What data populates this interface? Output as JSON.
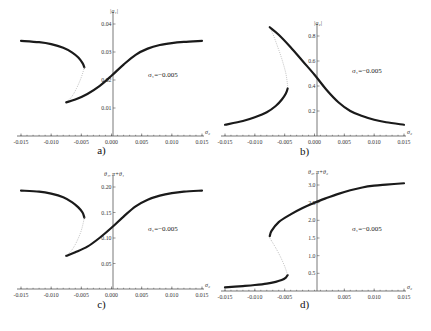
{
  "chart_data": [
    {
      "id": "a",
      "type": "line",
      "panel_label": "a)",
      "ylabel": "|a₁|",
      "xlabel": "σ₂",
      "annotation": "σ₁=−0.005",
      "xlim": [
        -0.015,
        0.015
      ],
      "ylim": [
        0,
        0.04
      ],
      "xticks": [
        "-0.015",
        "-0.010",
        "-0.005",
        "0.000",
        "0.005",
        "0.010",
        "0.015"
      ],
      "xtick_values": [
        -0.015,
        -0.01,
        -0.005,
        0.0,
        0.005,
        0.01,
        0.015
      ],
      "yticks": [
        "0.01",
        "0.02",
        "0.03",
        "0.04"
      ],
      "ytick_values": [
        0.01,
        0.02,
        0.03,
        0.04
      ],
      "series": [
        {
          "name": "stable-upper",
          "style": "stable",
          "x": [
            -0.015,
            -0.012,
            -0.01,
            -0.008,
            -0.0065,
            -0.0055,
            -0.0048,
            -0.0045
          ],
          "y": [
            0.034,
            0.0335,
            0.0328,
            0.0315,
            0.0298,
            0.028,
            0.026,
            0.0245
          ]
        },
        {
          "name": "unstable",
          "style": "unstable",
          "x": [
            -0.0045,
            -0.005,
            -0.0058,
            -0.0066,
            -0.0075
          ],
          "y": [
            0.0245,
            0.021,
            0.017,
            0.014,
            0.012
          ]
        },
        {
          "name": "stable-lower",
          "style": "stable",
          "x": [
            -0.0075,
            -0.006,
            -0.004,
            -0.002,
            0.0,
            0.002,
            0.004,
            0.006,
            0.008,
            0.01,
            0.012,
            0.015
          ],
          "y": [
            0.012,
            0.013,
            0.015,
            0.0178,
            0.0215,
            0.0255,
            0.029,
            0.0312,
            0.0325,
            0.0332,
            0.0336,
            0.034
          ]
        }
      ]
    },
    {
      "id": "b",
      "type": "line",
      "panel_label": "b)",
      "ylabel": "|a₂|",
      "xlabel": "σ₂",
      "annotation": "σ₁=−0.005",
      "xlim": [
        -0.015,
        0.015
      ],
      "ylim": [
        0,
        0.9
      ],
      "xticks": [
        "-0.015",
        "-0.010",
        "-0.005",
        "0.000",
        "0.005",
        "0.010",
        "0.015"
      ],
      "xtick_values": [
        -0.015,
        -0.01,
        -0.005,
        0.0,
        0.005,
        0.01,
        0.015
      ],
      "yticks": [
        "0.2",
        "0.4",
        "0.6",
        "0.8"
      ],
      "ytick_values": [
        0.2,
        0.4,
        0.6,
        0.8
      ],
      "series": [
        {
          "name": "stable-lower",
          "style": "stable",
          "x": [
            -0.015,
            -0.012,
            -0.01,
            -0.008,
            -0.0065,
            -0.0055,
            -0.0048,
            -0.0045
          ],
          "y": [
            0.09,
            0.12,
            0.15,
            0.19,
            0.24,
            0.29,
            0.34,
            0.38
          ]
        },
        {
          "name": "unstable",
          "style": "unstable",
          "x": [
            -0.0045,
            -0.0048,
            -0.0055,
            -0.0063,
            -0.007,
            -0.0075
          ],
          "y": [
            0.4,
            0.5,
            0.62,
            0.73,
            0.82,
            0.87
          ]
        },
        {
          "name": "stable-upper",
          "style": "stable",
          "x": [
            -0.0075,
            -0.006,
            -0.004,
            -0.002,
            0.0,
            0.002,
            0.004,
            0.006,
            0.008,
            0.01,
            0.012,
            0.015
          ],
          "y": [
            0.87,
            0.81,
            0.71,
            0.6,
            0.49,
            0.37,
            0.27,
            0.2,
            0.16,
            0.13,
            0.11,
            0.09
          ]
        }
      ]
    },
    {
      "id": "c",
      "type": "line",
      "panel_label": "c)",
      "ylabel": "θ₁, π+θ₁",
      "xlabel": "σ₂",
      "annotation": "σ₁=−0.005",
      "xlim": [
        -0.015,
        0.015
      ],
      "ylim": [
        0,
        0.2
      ],
      "xticks": [
        "-0.015",
        "-0.010",
        "-0.005",
        "0.000",
        "0.005",
        "0.010",
        "0.015"
      ],
      "xtick_values": [
        -0.015,
        -0.01,
        -0.005,
        0.0,
        0.005,
        0.01,
        0.015
      ],
      "yticks": [
        "0.05",
        "0.10",
        "0.15",
        "0.20"
      ],
      "ytick_values": [
        0.05,
        0.1,
        0.15,
        0.2
      ],
      "series": [
        {
          "name": "stable-upper",
          "style": "stable",
          "x": [
            -0.015,
            -0.012,
            -0.01,
            -0.008,
            -0.0065,
            -0.0055,
            -0.0048,
            -0.0045
          ],
          "y": [
            0.193,
            0.191,
            0.187,
            0.18,
            0.17,
            0.16,
            0.15,
            0.14
          ]
        },
        {
          "name": "unstable",
          "style": "unstable",
          "x": [
            -0.0045,
            -0.005,
            -0.0058,
            -0.0066,
            -0.0075
          ],
          "y": [
            0.14,
            0.115,
            0.092,
            0.076,
            0.065
          ]
        },
        {
          "name": "stable-lower",
          "style": "stable",
          "x": [
            -0.0075,
            -0.006,
            -0.004,
            -0.002,
            0.0,
            0.002,
            0.004,
            0.006,
            0.008,
            0.01,
            0.012,
            0.015
          ],
          "y": [
            0.065,
            0.072,
            0.083,
            0.1,
            0.12,
            0.142,
            0.162,
            0.175,
            0.183,
            0.188,
            0.191,
            0.193
          ]
        }
      ]
    },
    {
      "id": "d",
      "type": "line",
      "panel_label": "d)",
      "ylabel": "θ₂, π+θ₂",
      "xlabel": "σ₂",
      "annotation": "σ₁=−0.005",
      "xlim": [
        -0.015,
        0.015
      ],
      "ylim": [
        0,
        3.1
      ],
      "xticks": [
        "-0.015",
        "-0.010",
        "-0.005",
        "0.005",
        "0.010",
        "0.015"
      ],
      "xtick_values": [
        -0.015,
        -0.01,
        -0.005,
        0.005,
        0.01,
        0.015
      ],
      "yticks": [
        "0.5",
        "1.0",
        "1.5",
        "2.0",
        "2.5",
        "3.0"
      ],
      "ytick_values": [
        0.5,
        1.0,
        1.5,
        2.0,
        2.5,
        3.0
      ],
      "series": [
        {
          "name": "stable-lower",
          "style": "stable",
          "x": [
            -0.015,
            -0.012,
            -0.01,
            -0.008,
            -0.0065,
            -0.0055,
            -0.0048,
            -0.0045
          ],
          "y": [
            0.1,
            0.14,
            0.17,
            0.21,
            0.26,
            0.31,
            0.38,
            0.45
          ]
        },
        {
          "name": "unstable",
          "style": "unstable",
          "x": [
            -0.0045,
            -0.005,
            -0.0058,
            -0.0066,
            -0.0072,
            -0.0075
          ],
          "y": [
            0.45,
            0.7,
            1.0,
            1.25,
            1.42,
            1.5
          ]
        },
        {
          "name": "stable-upper",
          "style": "stable",
          "x": [
            -0.0075,
            -0.0072,
            -0.006,
            -0.004,
            -0.002,
            0.0,
            0.002,
            0.004,
            0.006,
            0.008,
            0.01,
            0.012,
            0.015
          ],
          "y": [
            1.55,
            1.7,
            1.95,
            2.17,
            2.35,
            2.5,
            2.63,
            2.75,
            2.85,
            2.93,
            2.98,
            3.01,
            3.05
          ]
        }
      ]
    }
  ]
}
